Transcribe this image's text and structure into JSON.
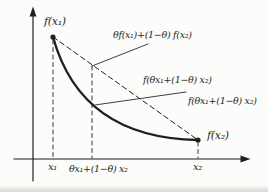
{
  "figure": {
    "background_color": "#fcfcfa",
    "ink_color": "#1f1f1f",
    "point_labels": {
      "f_x1": "f(x₁)",
      "f_x2": "f(x₂)"
    },
    "annotations": {
      "chord_value": "θf(x₁)+(1−θ) f(x₂)",
      "curve_value_upper": "f(θx₁+(1−θ) x₂)",
      "curve_value_lower": "f(θx₁+(1−θ) x₂)"
    },
    "x_axis_labels": {
      "x1": "x₁",
      "x_mid": "θx₁+(1−θ) x₂",
      "x2": "x₂"
    }
  }
}
